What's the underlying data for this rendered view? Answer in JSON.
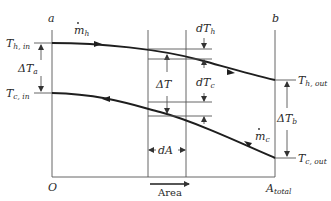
{
  "diagram": {
    "stations": {
      "left": "a",
      "right": "b"
    },
    "origin_label": "O",
    "area_end_label": {
      "main": "A",
      "sub": "total"
    },
    "area_axis_label": "Area",
    "streams": {
      "hot": {
        "flow_label": {
          "main": "m",
          "sub": "h"
        },
        "inlet": {
          "main": "T",
          "sub": "h, in"
        },
        "outlet": {
          "main": "T",
          "sub": "h, out"
        }
      },
      "cold": {
        "flow_label": {
          "main": "m",
          "sub": "c"
        },
        "inlet": {
          "main": "T",
          "sub": "c, in"
        },
        "outlet": {
          "main": "T",
          "sub": "c, out"
        }
      }
    },
    "differences": {
      "delta_Ta": {
        "main": "ΔT",
        "sub": "a"
      },
      "delta_Tb": {
        "main": "ΔT",
        "sub": "b"
      },
      "delta_T": "ΔT",
      "dTh": {
        "main": "dT",
        "sub": "h"
      },
      "dTc": {
        "main": "dT",
        "sub": "c"
      },
      "dA": "dA"
    },
    "colors": {
      "line": "#1e1e1e",
      "guide": "#555555",
      "background": "#ffffff"
    }
  }
}
